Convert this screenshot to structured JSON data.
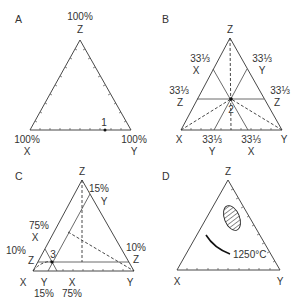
{
  "figure": {
    "panels": [
      {
        "id": "A",
        "label": "A",
        "apex_top_label": "100%",
        "apex_label": "Z",
        "left_label": "100%",
        "left_sub": "X",
        "right_label": "100%",
        "right_sub": "Y",
        "point_label": "1"
      },
      {
        "id": "B",
        "label": "B",
        "apex_label": "Z",
        "left_vertex": "X",
        "right_vertex": "Y",
        "point_label": "2",
        "frac": "33⅓",
        "left_upper_frac": "33⅓",
        "left_upper_letter": "X",
        "right_upper_frac": "33⅓",
        "right_upper_letter": "Y",
        "left_mid_frac": "33⅓",
        "left_mid_letter": "Z",
        "right_mid_frac": "33⅓",
        "right_mid_letter": "Z",
        "base_left_frac": "33⅓",
        "base_left_letter": "Y",
        "base_right_frac": "33⅓",
        "base_right_letter": "X"
      },
      {
        "id": "C",
        "label": "C",
        "apex_label": "Z",
        "left_vertex": "X",
        "right_vertex": "Y",
        "point_label": "3",
        "right_upper_pct": "15%",
        "right_upper_letter": "Y",
        "left_upper_pct": "75%",
        "left_upper_letter": "X",
        "left_mid_pct": "10%",
        "left_mid_letter": "Z",
        "right_mid_pct": "10%",
        "right_mid_letter": "Z",
        "base_y_letter": "Y",
        "base_y_pct": "15%",
        "base_x_letter": "X",
        "base_x_pct": "75%"
      },
      {
        "id": "D",
        "label": "D",
        "apex_label": "Z",
        "left_vertex": "X",
        "right_vertex": "Y",
        "isotherm_label": "1250°C"
      }
    ]
  }
}
